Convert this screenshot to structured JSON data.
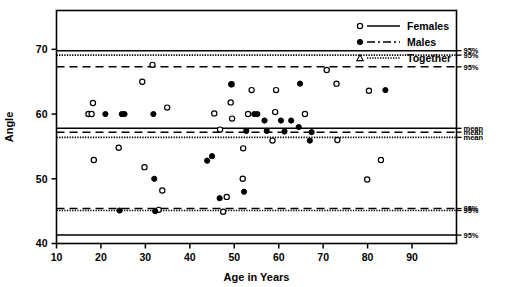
{
  "chart_data": {
    "type": "scatter",
    "title": "",
    "xlabel": "Age in Years",
    "ylabel": "Angle",
    "xlim": [
      10,
      100
    ],
    "ylim": [
      40,
      76
    ],
    "xticks": [
      10,
      20,
      30,
      40,
      50,
      60,
      70,
      80,
      90
    ],
    "yticks": [
      40,
      50,
      60,
      70
    ],
    "xtick_labels": [
      "10",
      "20",
      "30",
      "40",
      "50",
      "60",
      "70",
      "80",
      "90"
    ],
    "ytick_labels": [
      "40",
      "50",
      "60",
      "70"
    ],
    "grid": false,
    "legend_position": "top-right",
    "series": [
      {
        "name": "Females",
        "marker": "open-circle",
        "line_style": "solid",
        "points": [
          [
            17.2,
            60.0
          ],
          [
            17.9,
            60.0
          ],
          [
            18.2,
            61.7
          ],
          [
            18.4,
            52.9
          ],
          [
            24.0,
            54.8
          ],
          [
            29.3,
            65.0
          ],
          [
            29.8,
            51.8
          ],
          [
            31.6,
            67.6
          ],
          [
            33.0,
            45.2
          ],
          [
            33.8,
            48.2
          ],
          [
            34.9,
            61.0
          ],
          [
            45.5,
            60.1
          ],
          [
            46.8,
            57.6
          ],
          [
            47.5,
            44.9
          ],
          [
            48.3,
            47.2
          ],
          [
            49.2,
            61.8
          ],
          [
            49.4,
            64.6
          ],
          [
            49.5,
            59.3
          ],
          [
            51.9,
            50.0
          ],
          [
            53.1,
            60.0
          ],
          [
            52.0,
            54.7
          ],
          [
            53.9,
            63.7
          ],
          [
            58.6,
            55.9
          ],
          [
            59.2,
            60.3
          ],
          [
            59.4,
            63.7
          ],
          [
            65.9,
            60.0
          ],
          [
            70.8,
            66.8
          ],
          [
            73.0,
            64.7
          ],
          [
            73.2,
            56.0
          ],
          [
            79.9,
            49.9
          ],
          [
            80.3,
            63.6
          ],
          [
            83.0,
            52.9
          ]
        ]
      },
      {
        "name": "Males",
        "marker": "filled-circle",
        "line_style": "dash-dot",
        "points": [
          [
            21.0,
            60.0
          ],
          [
            24.2,
            45.1
          ],
          [
            24.7,
            60.0
          ],
          [
            25.3,
            60.0
          ],
          [
            31.8,
            60.0
          ],
          [
            32.0,
            50.0
          ],
          [
            32.2,
            45.0
          ],
          [
            43.9,
            52.8
          ],
          [
            45.0,
            53.5
          ],
          [
            46.7,
            47.0
          ],
          [
            49.3,
            64.6
          ],
          [
            52.2,
            48.0
          ],
          [
            52.7,
            57.4
          ],
          [
            54.5,
            60.0
          ],
          [
            55.2,
            60.0
          ],
          [
            56.8,
            59.0
          ],
          [
            57.3,
            57.4
          ],
          [
            60.5,
            59.0
          ],
          [
            61.3,
            57.3
          ],
          [
            62.8,
            59.0
          ],
          [
            64.5,
            58.0
          ],
          [
            64.8,
            64.7
          ],
          [
            67.0,
            55.9
          ],
          [
            67.4,
            57.2
          ],
          [
            84.0,
            63.7
          ]
        ]
      },
      {
        "name": "Together",
        "marker": "triangle",
        "line_style": "dotted",
        "points": []
      }
    ],
    "reference_lines": [
      {
        "group": "Females",
        "type": "95% upper",
        "value": 69.8,
        "style": "solid",
        "label": "95%"
      },
      {
        "group": "Together",
        "type": "95% upper",
        "value": 69.1,
        "style": "dotted",
        "label": "95%"
      },
      {
        "group": "Males",
        "type": "95% upper",
        "value": 67.3,
        "style": "dashed",
        "label": "95%"
      },
      {
        "group": "Females",
        "type": "mean",
        "value": 57.8,
        "style": "solid",
        "label": "mean"
      },
      {
        "group": "Males",
        "type": "mean",
        "value": 57.2,
        "style": "dashed",
        "label": "mean"
      },
      {
        "group": "Together",
        "type": "mean",
        "value": 56.4,
        "style": "dotted",
        "label": "mean"
      },
      {
        "group": "Males",
        "type": "95% lower",
        "value": 45.4,
        "style": "dashed",
        "label": "95%"
      },
      {
        "group": "Together",
        "type": "95% lower",
        "value": 45.1,
        "style": "dotted",
        "label": "95%"
      },
      {
        "group": "Females",
        "type": "95% lower",
        "value": 41.3,
        "style": "solid",
        "label": "95%"
      }
    ]
  },
  "legend": {
    "items": [
      {
        "label": "Females",
        "marker": "open-circle",
        "line": "solid"
      },
      {
        "label": "Males",
        "marker": "filled-circle",
        "line": "dash-dot"
      },
      {
        "label": "Together",
        "marker": "triangle",
        "line": "dotted"
      }
    ]
  },
  "axes": {
    "x_title": "Age in Years",
    "y_title": "Angle"
  },
  "colors": {
    "ink": "#000000",
    "background": "#ffffff"
  }
}
